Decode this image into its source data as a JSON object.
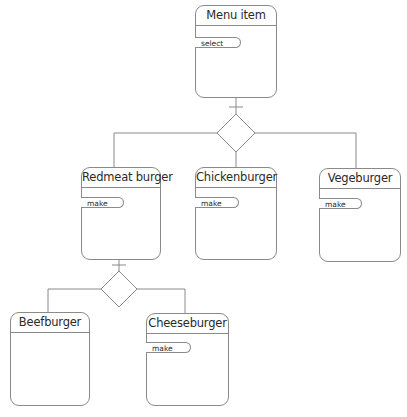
{
  "diagram": {
    "type": "class-hierarchy",
    "classes": [
      {
        "id": "menu-item",
        "name": "Menu item",
        "operations": [
          "select"
        ]
      },
      {
        "id": "redmeat-burger",
        "name": "Redmeat burger",
        "operations": [
          "make"
        ],
        "parent": "menu-item"
      },
      {
        "id": "chickenburger",
        "name": "Chickenburger",
        "operations": [
          "make"
        ],
        "parent": "menu-item"
      },
      {
        "id": "vegeburger",
        "name": "Vegeburger",
        "operations": [
          "make"
        ],
        "parent": "menu-item"
      },
      {
        "id": "beefburger",
        "name": "Beefburger",
        "operations": [],
        "parent": "redmeat-burger"
      },
      {
        "id": "cheeseburger",
        "name": "Cheeseburger",
        "operations": [
          "make"
        ],
        "parent": "redmeat-burger"
      }
    ],
    "relationships": [
      {
        "type": "generalization",
        "parent": "Menu item",
        "children": [
          "Redmeat burger",
          "Chickenburger",
          "Vegeburger"
        ]
      },
      {
        "type": "generalization",
        "parent": "Redmeat burger",
        "children": [
          "Beefburger",
          "Cheeseburger"
        ]
      }
    ],
    "colors": {
      "line": "#8a8a8a",
      "text": "#2a2a2a",
      "background": "#ffffff"
    }
  },
  "labels": {
    "menu_item": "Menu item",
    "menu_item_op": "select",
    "redmeat": "Redmeat burger",
    "redmeat_op": "make",
    "chicken": "Chickenburger",
    "chicken_op": "make",
    "vege": "Vegeburger",
    "vege_op": "make",
    "beef": "Beefburger",
    "cheese": "Cheeseburger",
    "cheese_op": "make"
  }
}
